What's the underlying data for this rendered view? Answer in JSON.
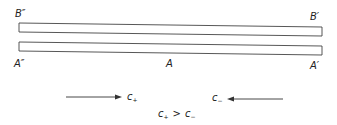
{
  "diagram": {
    "labels": {
      "top_left": "B″",
      "top_right": "B′",
      "bottom_left": "A″",
      "bottom_middle": "A",
      "bottom_right": "A′"
    },
    "arrows": {
      "right": {
        "symbol": "c",
        "subscript": "+"
      },
      "left": {
        "symbol": "c",
        "subscript": "−"
      }
    },
    "relation": {
      "lhs": "c",
      "lhs_sub": "+",
      "op": ">",
      "rhs": "c",
      "rhs_sub": "−"
    }
  }
}
